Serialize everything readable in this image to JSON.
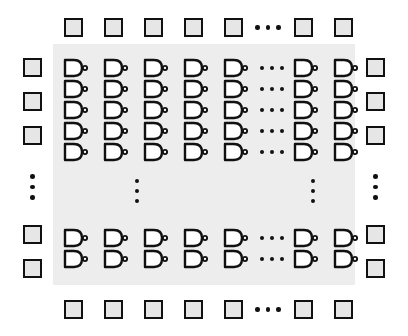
{
  "diagram": {
    "background_color": "#ffffff",
    "core": {
      "label": "gate-array-core",
      "fill_color": "#ededed",
      "x": 53,
      "y": 44,
      "width": 302,
      "height": 241
    },
    "io_pad": {
      "label": "io-pad",
      "fill_color": "#e6e6e6",
      "border_color": "#111111",
      "size": 19,
      "border_width": 2.5
    },
    "gate": {
      "label": "nand-gate",
      "type": "NAND",
      "body_fill": "#ffffff",
      "stroke_color": "#111111",
      "width": 26,
      "height": 20
    },
    "ellipsis": {
      "dot_color": "#111111",
      "dot_count": 3,
      "horizontal_label": "horizontal-ellipsis",
      "vertical_label": "vertical-ellipsis"
    },
    "grid": {
      "gate_columns_before_break": 5,
      "gate_columns_after_break": 2,
      "gate_rows_before_break": 5,
      "gate_rows_after_break": 2,
      "pad_columns_before_break": 5,
      "pad_columns_after_break": 2,
      "pad_rows_before_break": 3,
      "pad_rows_after_break": 2
    },
    "gate_column_x": [
      62,
      102,
      142,
      182,
      222,
      292,
      332
    ],
    "gate_row_y": [
      58,
      79,
      100,
      121,
      142,
      228,
      249
    ],
    "gate_col_ellipsis_x": 255,
    "gate_row_ellipsis_y": [
      180,
      190,
      200
    ],
    "gate_row_ellipsis_cols": [
      137,
      313
    ],
    "pad_top_y": 18,
    "pad_bottom_y": 300,
    "pad_left_x": 23,
    "pad_right_x": 366,
    "pad_column_x": [
      64,
      104,
      144,
      184,
      224,
      294,
      334
    ],
    "pad_row_y": [
      58,
      92,
      126,
      225,
      259
    ],
    "pad_col_ellipsis_x": 258,
    "pad_row_ellipsis_y": 183
  }
}
